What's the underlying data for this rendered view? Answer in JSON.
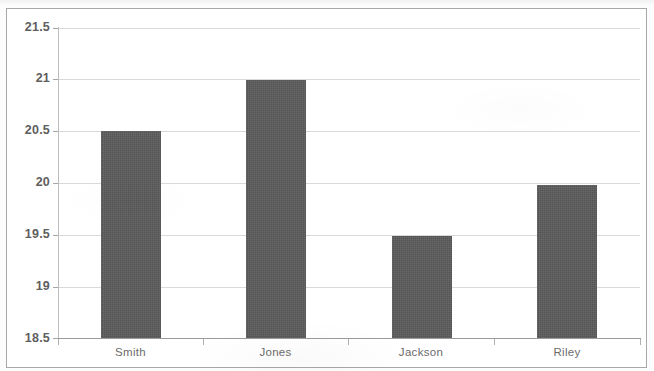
{
  "chart_data": {
    "type": "bar",
    "title": "",
    "subtitle": "",
    "xlabel": "",
    "ylabel": "",
    "categories": [
      "Smith",
      "Jones",
      "Jackson",
      "Riley"
    ],
    "values": [
      20.5,
      21.0,
      19.49,
      19.98
    ],
    "series": [
      {
        "name": "",
        "values": [
          20.5,
          21.0,
          19.49,
          19.98
        ]
      }
    ],
    "ylim": [
      18.5,
      21.5
    ],
    "y_ticks": [
      18.5,
      19,
      19.5,
      20,
      20.5,
      21,
      21.5
    ],
    "y_tick_labels": [
      "18.5",
      "19",
      "19.5",
      "20",
      "20.5",
      "21",
      "21.5"
    ],
    "grid": true,
    "grid_axis": "y",
    "legend": false,
    "legend_position": "none",
    "annotations": [],
    "colors": {
      "bar_fill": "#595959",
      "gridline": "#d9d9d9",
      "axis_line": "#9a9a9a",
      "tick_label": "#5e5e5e",
      "category_label": "#6b6b6b",
      "frame_border": "#a8a8a8",
      "background": "#ffffff"
    }
  }
}
